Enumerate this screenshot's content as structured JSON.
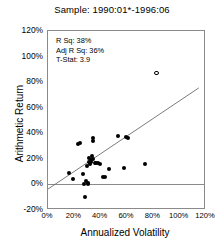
{
  "chart_data": {
    "type": "scatter",
    "title": "Sample: 1990:01*-1996:06",
    "xlabel": "Annualized Volatility",
    "ylabel": "Arithmetic Return",
    "xlim": [
      0,
      120
    ],
    "ylim": [
      -20,
      120
    ],
    "xticks": [
      "0%",
      "20%",
      "40%",
      "60%",
      "80%",
      "100%",
      "120%"
    ],
    "xtick_values": [
      0,
      20,
      40,
      60,
      80,
      100,
      120
    ],
    "yticks": [
      "-20%",
      "0%",
      "20%",
      "40%",
      "60%",
      "80%",
      "100%",
      "120%"
    ],
    "ytick_values": [
      -20,
      0,
      20,
      40,
      60,
      80,
      100,
      120
    ],
    "grid": false,
    "legend": null,
    "zero_line": 0,
    "annotations": [
      {
        "label": "R Sq: 38%"
      },
      {
        "label": "Adj R Sq: 36%"
      },
      {
        "label": "T-Stat: 3.9"
      }
    ],
    "series": [
      {
        "name": "Funds",
        "marker": "filled-circle",
        "color": "#000000",
        "points": [
          [
            16.0,
            9.0
          ],
          [
            19.0,
            4.0
          ],
          [
            22.5,
            32.0
          ],
          [
            24.5,
            32.5
          ],
          [
            26.5,
            8.5
          ],
          [
            27.5,
            0.5
          ],
          [
            28.0,
            -9.5
          ],
          [
            28.5,
            3.0
          ],
          [
            29.5,
            14.5
          ],
          [
            30.0,
            1.0
          ],
          [
            30.5,
            0.5
          ],
          [
            31.0,
            20.5
          ],
          [
            31.5,
            17.5
          ],
          [
            32.0,
            16.0
          ],
          [
            32.5,
            19.0
          ],
          [
            33.0,
            17.5
          ],
          [
            33.5,
            22.0
          ],
          [
            34.0,
            19.5
          ],
          [
            34.5,
            34.0
          ],
          [
            34.5,
            36.5
          ],
          [
            35.5,
            17.0
          ],
          [
            36.5,
            16.5
          ],
          [
            38.0,
            16.5
          ],
          [
            39.5,
            16.0
          ],
          [
            41.5,
            6.0
          ],
          [
            43.0,
            5.5
          ],
          [
            46.0,
            12.0
          ],
          [
            53.0,
            37.5
          ],
          [
            58.0,
            12.5
          ],
          [
            59.5,
            37.0
          ],
          [
            61.0,
            36.5
          ],
          [
            73.5,
            16.0
          ]
        ]
      },
      {
        "name": "Outlier",
        "marker": "hollow-circle",
        "color": "#000000",
        "points": [
          [
            82.5,
            87.0
          ]
        ]
      }
    ],
    "regression_line": {
      "x_start": 0,
      "y_start": -5.0,
      "x_end": 116.0,
      "y_end": 75.0,
      "color": "#6a6a6a"
    }
  }
}
